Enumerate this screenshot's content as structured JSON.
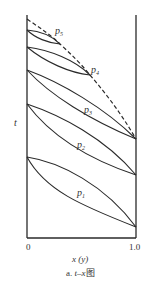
{
  "diagram": {
    "type": "phase-diagram",
    "title": "a. t–x图",
    "caption": {
      "prefix": "a. ",
      "var": "t",
      "dash": "–",
      "var2": "x",
      "suffix": "图"
    },
    "y_axis_label": "t",
    "x_axis_label": "x (y)",
    "x_ticks": [
      "0",
      "1.0"
    ],
    "colors": {
      "line": "#2a2a2a",
      "text": "#333333"
    },
    "loops": [
      {
        "label": "p",
        "sub": "1",
        "left": [
          27,
          157
        ],
        "right": [
          136,
          227
        ]
      },
      {
        "label": "p",
        "sub": "2",
        "left": [
          27,
          104
        ],
        "right": [
          136,
          175
        ]
      },
      {
        "label": "p",
        "sub": "3",
        "left": [
          27,
          70
        ],
        "right": [
          136,
          139
        ]
      },
      {
        "label": "p",
        "sub": "4",
        "left": [
          27,
          47
        ],
        "right": [
          90,
          75
        ]
      },
      {
        "label": "p",
        "sub": "5",
        "left": [
          27,
          30
        ],
        "right": [
          60,
          44
        ]
      }
    ],
    "critical_curve": "dashed line through loop endpoints"
  }
}
